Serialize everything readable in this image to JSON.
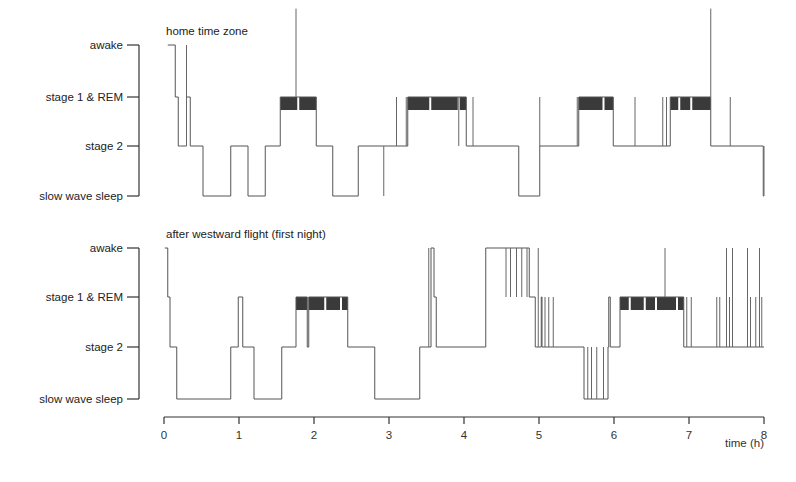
{
  "chart_data": {
    "type": "line",
    "subtype": "hypnogram-step",
    "xlabel": "time (h)",
    "x_ticks": [
      0,
      1,
      2,
      3,
      4,
      5,
      6,
      7,
      8
    ],
    "xlim": [
      0,
      8
    ],
    "y_levels": [
      "slow wave sleep",
      "stage 2",
      "stage 1 & REM",
      "awake"
    ],
    "level_codes": {
      "slow wave sleep": 0,
      "stage 2": 1,
      "stage 1 & REM": 2,
      "awake": 3
    },
    "panels": [
      {
        "title": "home time zone",
        "steps": [
          [
            0.05,
            3
          ],
          [
            0.15,
            2
          ],
          [
            0.19,
            1
          ],
          [
            0.22,
            1
          ],
          [
            0.3,
            2
          ],
          [
            0.35,
            1
          ],
          [
            0.52,
            0
          ],
          [
            0.89,
            1
          ],
          [
            1.12,
            0
          ],
          [
            1.35,
            1
          ],
          [
            1.55,
            2
          ],
          [
            2.03,
            1
          ],
          [
            2.25,
            0
          ],
          [
            2.59,
            1
          ],
          [
            3.25,
            2
          ],
          [
            4.03,
            1
          ],
          [
            4.73,
            0
          ],
          [
            5.01,
            1
          ],
          [
            5.53,
            2
          ],
          [
            5.99,
            1
          ],
          [
            6.75,
            2
          ],
          [
            7.29,
            1
          ],
          [
            7.99,
            0
          ],
          [
            8.0,
            0
          ]
        ],
        "rem_blocks": [
          [
            1.55,
            2.03
          ],
          [
            3.25,
            4.03
          ],
          [
            5.53,
            5.99
          ],
          [
            6.75,
            7.29
          ]
        ],
        "rem_gaps": [
          1.79,
          3.55,
          3.93,
          5.86,
          6.87,
          7.03
        ],
        "spikes": [
          {
            "t": 0.3,
            "from": 1,
            "to": 3
          },
          {
            "t": 1.76,
            "from": 2,
            "to": 3.7
          },
          {
            "t": 2.93,
            "from": 0,
            "to": 1
          },
          {
            "t": 3.1,
            "from": 1,
            "to": 2
          },
          {
            "t": 3.23,
            "from": 1,
            "to": 2
          },
          {
            "t": 3.93,
            "from": 2,
            "to": 1
          },
          {
            "t": 4.12,
            "from": 1,
            "to": 2
          },
          {
            "t": 5.01,
            "from": 1,
            "to": 2
          },
          {
            "t": 5.51,
            "from": 1,
            "to": 2
          },
          {
            "t": 6.28,
            "from": 1,
            "to": 2
          },
          {
            "t": 6.65,
            "from": 1,
            "to": 2
          },
          {
            "t": 6.7,
            "from": 1,
            "to": 2
          },
          {
            "t": 7.29,
            "from": 2,
            "to": 3.7
          },
          {
            "t": 7.55,
            "from": 1,
            "to": 2
          },
          {
            "t": 8.0,
            "from": 1,
            "to": 0
          }
        ]
      },
      {
        "title": "after westward flight (first night)",
        "steps": [
          [
            0.01,
            3
          ],
          [
            0.05,
            2
          ],
          [
            0.08,
            1
          ],
          [
            0.17,
            0
          ],
          [
            0.89,
            1
          ],
          [
            0.99,
            2
          ],
          [
            1.05,
            1
          ],
          [
            1.2,
            0
          ],
          [
            1.57,
            1
          ],
          [
            1.76,
            2
          ],
          [
            1.91,
            1
          ],
          [
            1.93,
            2
          ],
          [
            2.45,
            1
          ],
          [
            2.81,
            0
          ],
          [
            3.41,
            1
          ],
          [
            3.56,
            3
          ],
          [
            3.6,
            2
          ],
          [
            3.63,
            1
          ],
          [
            4.29,
            3
          ],
          [
            4.87,
            2
          ],
          [
            4.95,
            1
          ],
          [
            5.03,
            2
          ],
          [
            5.04,
            1
          ],
          [
            5.6,
            0
          ],
          [
            5.92,
            1
          ],
          [
            5.93,
            2
          ],
          [
            5.95,
            1
          ],
          [
            6.08,
            2
          ],
          [
            6.93,
            1
          ],
          [
            8.0,
            1
          ]
        ],
        "rem_blocks": [
          [
            1.76,
            1.91
          ],
          [
            1.93,
            2.45
          ],
          [
            6.08,
            6.93
          ]
        ],
        "rem_gaps": [
          2.15,
          2.36,
          6.21,
          6.41,
          6.56,
          6.84
        ],
        "spikes": [
          {
            "t": 3.53,
            "from": 1,
            "to": 3
          },
          {
            "t": 4.56,
            "from": 3,
            "to": 2
          },
          {
            "t": 4.62,
            "from": 3,
            "to": 2
          },
          {
            "t": 4.7,
            "from": 3,
            "to": 2
          },
          {
            "t": 4.77,
            "from": 3,
            "to": 2
          },
          {
            "t": 4.84,
            "from": 3,
            "to": 2
          },
          {
            "t": 4.99,
            "from": 1,
            "to": 3
          },
          {
            "t": 5.08,
            "from": 1,
            "to": 2
          },
          {
            "t": 5.13,
            "from": 1,
            "to": 2
          },
          {
            "t": 5.19,
            "from": 1,
            "to": 2
          },
          {
            "t": 5.65,
            "from": 1,
            "to": 0
          },
          {
            "t": 5.7,
            "from": 1,
            "to": 0
          },
          {
            "t": 5.77,
            "from": 1,
            "to": 0
          },
          {
            "t": 5.86,
            "from": 0,
            "to": 1
          },
          {
            "t": 6.68,
            "from": 2,
            "to": 3
          },
          {
            "t": 6.97,
            "from": 1,
            "to": 2
          },
          {
            "t": 7.03,
            "from": 1,
            "to": 2
          },
          {
            "t": 7.37,
            "from": 1,
            "to": 2
          },
          {
            "t": 7.41,
            "from": 1,
            "to": 2
          },
          {
            "t": 7.5,
            "from": 1,
            "to": 3
          },
          {
            "t": 7.54,
            "from": 1,
            "to": 2
          },
          {
            "t": 7.58,
            "from": 1,
            "to": 3
          },
          {
            "t": 7.78,
            "from": 1,
            "to": 3
          },
          {
            "t": 7.82,
            "from": 1,
            "to": 2
          },
          {
            "t": 7.89,
            "from": 1,
            "to": 2
          },
          {
            "t": 7.94,
            "from": 1,
            "to": 3
          },
          {
            "t": 7.97,
            "from": 1,
            "to": 2
          }
        ]
      }
    ]
  },
  "labels": {
    "xlabel": "time (h)",
    "ticks": [
      "0",
      "1",
      "2",
      "3",
      "4",
      "5",
      "6",
      "7",
      "8"
    ],
    "levels": [
      "awake",
      "stage 1 & REM",
      "stage 2",
      "slow wave sleep"
    ],
    "panel_titles": [
      "home time zone",
      "after westward flight (first night)"
    ]
  }
}
